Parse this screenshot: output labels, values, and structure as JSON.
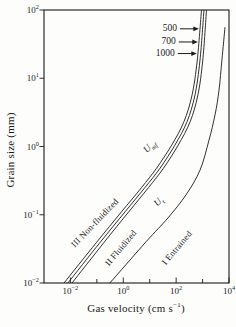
{
  "colors": {
    "ink": "#1b1b1b",
    "background": "#fdfdfc"
  },
  "axes": {
    "x": {
      "title_pre": "Gas velocity (cm s",
      "title_sup": "−1",
      "title_post": ")",
      "scale": "log",
      "log_min": -3,
      "log_max": 4,
      "major_ticks": [
        {
          "base": "10",
          "exp": "−2",
          "log": -2
        },
        {
          "base": "10",
          "exp": "0",
          "log": 0
        },
        {
          "base": "10",
          "exp": "2",
          "log": 2
        },
        {
          "base": "10",
          "exp": "4",
          "log": 4
        }
      ],
      "minor_tick_logs": [
        -1,
        1,
        3
      ]
    },
    "y": {
      "title": "Grain size (mm)",
      "scale": "log",
      "log_min": -2,
      "log_max": 2,
      "major_ticks": [
        {
          "base": "10",
          "exp": "2",
          "log": 2
        },
        {
          "base": "10",
          "exp": "1",
          "log": 1
        },
        {
          "base": "10",
          "exp": "0",
          "log": 0
        },
        {
          "base": "10",
          "exp": "−1",
          "log": -1
        },
        {
          "base": "10",
          "exp": "−2",
          "log": -2
        }
      ]
    }
  },
  "chart_data": {
    "type": "line",
    "title": "",
    "xlabel": "Gas velocity (cm s−1)",
    "ylabel": "Grain size (mm)",
    "x_scale": "log",
    "y_scale": "log",
    "xlim": [
      0.001,
      10000
    ],
    "ylim": [
      0.01,
      100
    ],
    "grid": false,
    "legend": "none",
    "series": [
      {
        "name": "U_mf, density 500",
        "v": [
          0.0057,
          0.095,
          0.85,
          4.9,
          18,
          68,
          196,
          400,
          630,
          910
        ],
        "d": [
          0.01,
          0.039,
          0.11,
          0.25,
          0.48,
          1.05,
          2.3,
          5.7,
          18.5,
          100
        ]
      },
      {
        "name": "U_mf, density 700",
        "v": [
          0.008,
          0.13,
          1.16,
          6.6,
          24.5,
          90,
          257,
          516,
          798,
          1130
        ],
        "d": [
          0.01,
          0.039,
          0.11,
          0.25,
          0.48,
          1.05,
          2.3,
          5.7,
          18.5,
          100
        ]
      },
      {
        "name": "U_mf, density 1000",
        "v": [
          0.0115,
          0.183,
          1.6,
          9.0,
          33,
          120,
          337,
          668,
          1016,
          1405
        ],
        "d": [
          0.01,
          0.039,
          0.11,
          0.25,
          0.48,
          1.05,
          2.3,
          5.7,
          18.5,
          100
        ]
      },
      {
        "name": "U_t (terminal velocity)",
        "v": [
          0.31,
          7.2,
          49,
          235,
          800,
          1750,
          2950,
          4200,
          5400,
          7050
        ],
        "d": [
          0.01,
          0.04,
          0.09,
          0.195,
          0.45,
          1.24,
          2.9,
          6.7,
          18.5,
          56
        ]
      }
    ],
    "annotations": {
      "regions": [
        {
          "text": "III Non-fluidized",
          "v": 0.085,
          "d": 0.076,
          "rot": -46
        },
        {
          "text": "II Fluidized",
          "v": 0.82,
          "d": 0.033,
          "rot": -50
        },
        {
          "text": "I Entrained",
          "v": 108,
          "d": 0.033,
          "rot": -50
        }
      ],
      "curve_labels": [
        {
          "main": "U",
          "sub": "mf",
          "v": 10,
          "d": 1.0,
          "rot": -46
        },
        {
          "main": "U",
          "sub": "t",
          "v": 22,
          "d": 0.155,
          "rot": -46
        }
      ],
      "density_labels": [
        {
          "label": "500",
          "at_d": 53,
          "target_series": 0
        },
        {
          "label": "700",
          "at_d": 34,
          "target_series": 0
        },
        {
          "label": "1000",
          "at_d": 23,
          "target_series": 0
        }
      ]
    }
  }
}
